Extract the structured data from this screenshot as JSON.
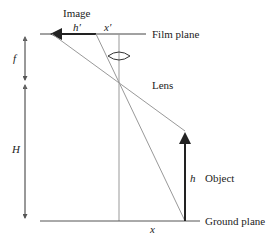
{
  "labels": {
    "image": "Image",
    "h_prime": "h′",
    "x_prime": "x′",
    "film_plane": "Film plane",
    "f": "f",
    "lens": "Lens",
    "H": "H",
    "h": "h",
    "object": "Object",
    "x": "x",
    "ground_plane": "Ground plane"
  },
  "colors": {
    "line": "#555555",
    "light_line": "#999999",
    "dark": "#222222"
  }
}
